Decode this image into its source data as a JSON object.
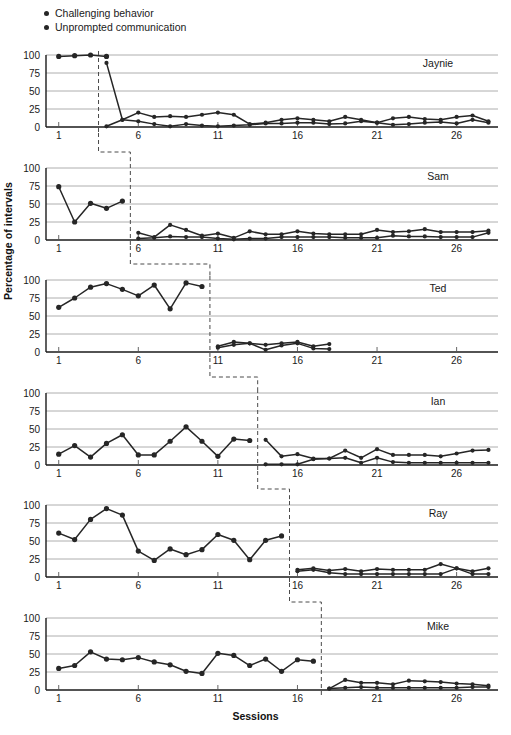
{
  "legend": {
    "items": [
      {
        "label": "Challenging behavior",
        "color": "#262626",
        "marker": "dot-icon"
      },
      {
        "label": "Unprompted communication",
        "color": "#262626",
        "marker": "dot-icon"
      }
    ]
  },
  "axes": {
    "ylabel": "Percentage of intervals",
    "xlabel": "Sessions",
    "yticks": [
      0,
      25,
      50,
      75,
      100
    ],
    "xticks": [
      1,
      6,
      11,
      16,
      21,
      26
    ],
    "ylim": [
      0,
      100
    ],
    "xlim": [
      0.2,
      28.6
    ],
    "grid": true
  },
  "chart_data": {
    "type": "line",
    "title": "",
    "subtitle": "",
    "xlabel": "Sessions",
    "ylabel": "Percentage of intervals",
    "ylim": [
      0,
      100
    ],
    "xlim": [
      0.2,
      28.6
    ],
    "yticks": [
      0,
      25,
      50,
      75,
      100
    ],
    "xticks": [
      1,
      6,
      11,
      16,
      21,
      26
    ],
    "grid": true,
    "legend_position": "top-left",
    "legend": [
      "Challenging behavior",
      "Unprompted communication"
    ],
    "design": "multiple-baseline-across-participants",
    "panels": [
      {
        "name": "Jaynie",
        "baseline_end_session": 3.5,
        "series": [
          {
            "name": "Challenging behavior",
            "baseline": {
              "x": [
                1,
                2,
                3,
                4
              ],
              "y": [
                98,
                99,
                100,
                98
              ]
            },
            "intervention": {
              "x": [
                4,
                5,
                6,
                7,
                8,
                9,
                10,
                11,
                12,
                13,
                14,
                15,
                16,
                17,
                18,
                19,
                20,
                21,
                22,
                23,
                24,
                25,
                26,
                27,
                28
              ],
              "y": [
                89,
                10,
                8,
                4,
                1,
                4,
                2,
                1,
                2,
                3,
                5,
                5,
                6,
                6,
                4,
                5,
                8,
                6,
                3,
                4,
                6,
                7,
                5,
                10,
                6
              ]
            }
          },
          {
            "name": "Unprompted communication",
            "baseline": {
              "x": [],
              "y": []
            },
            "intervention": {
              "x": [
                4,
                5,
                6,
                7,
                8,
                9,
                10,
                11,
                12,
                13,
                14,
                15,
                16,
                17,
                18,
                19,
                20,
                21,
                22,
                23,
                24,
                25,
                26,
                27,
                28
              ],
              "y": [
                1,
                10,
                20,
                14,
                15,
                14,
                17,
                20,
                17,
                4,
                6,
                10,
                12,
                10,
                8,
                14,
                10,
                6,
                12,
                14,
                11,
                10,
                14,
                16,
                8
              ]
            }
          }
        ]
      },
      {
        "name": "Sam",
        "baseline_end_session": 5.5,
        "series": [
          {
            "name": "Challenging behavior",
            "baseline": {
              "x": [
                1,
                2,
                3,
                4,
                5
              ],
              "y": [
                74,
                25,
                51,
                44,
                54
              ]
            },
            "intervention": {
              "x": [
                6,
                7,
                8,
                9,
                10,
                11,
                12,
                13,
                14,
                15,
                16,
                17,
                18,
                19,
                20,
                21,
                22,
                23,
                24,
                25,
                26,
                27,
                28
              ],
              "y": [
                2,
                3,
                5,
                4,
                4,
                2,
                1,
                2,
                2,
                4,
                4,
                4,
                4,
                3,
                3,
                3,
                6,
                5,
                5,
                4,
                4,
                4,
                10
              ]
            }
          },
          {
            "name": "Unprompted communication",
            "baseline": {
              "x": [],
              "y": []
            },
            "intervention": {
              "x": [
                6,
                7,
                8,
                9,
                10,
                11,
                12,
                13,
                14,
                15,
                16,
                17,
                18,
                19,
                20,
                21,
                22,
                23,
                24,
                25,
                26,
                27,
                28
              ],
              "y": [
                10,
                4,
                21,
                14,
                6,
                9,
                3,
                12,
                8,
                8,
                12,
                9,
                8,
                8,
                8,
                14,
                11,
                12,
                15,
                11,
                11,
                11,
                13
              ]
            }
          }
        ]
      },
      {
        "name": "Ted",
        "baseline_end_session": 10.5,
        "series": [
          {
            "name": "Challenging behavior",
            "baseline": {
              "x": [
                1,
                2,
                3,
                4,
                5,
                6,
                7,
                8,
                9,
                10
              ],
              "y": [
                62,
                75,
                90,
                95,
                87,
                78,
                93,
                60,
                96,
                91
              ]
            },
            "intervention": {
              "x": [
                11,
                12,
                13,
                14,
                15,
                16,
                17,
                18
              ],
              "y": [
                6,
                10,
                12,
                3,
                9,
                12,
                5,
                4
              ]
            }
          },
          {
            "name": "Unprompted communication",
            "baseline": {
              "x": [],
              "y": []
            },
            "intervention": {
              "x": [
                11,
                12,
                13,
                14,
                15,
                16,
                17,
                18
              ],
              "y": [
                8,
                14,
                12,
                10,
                12,
                14,
                8,
                11
              ]
            }
          }
        ]
      },
      {
        "name": "Ian",
        "baseline_end_session": 13.5,
        "series": [
          {
            "name": "Challenging behavior",
            "baseline": {
              "x": [
                1,
                2,
                3,
                4,
                5,
                6,
                7,
                8,
                9,
                10,
                11,
                12,
                13
              ],
              "y": [
                15,
                27,
                11,
                30,
                42,
                14,
                14,
                33,
                53,
                33,
                12,
                36,
                34
              ]
            },
            "intervention": {
              "x": [
                14,
                15,
                16,
                17,
                18,
                19,
                20,
                21,
                22,
                23,
                24,
                25,
                26,
                27,
                28
              ],
              "y": [
                1,
                1,
                1,
                8,
                9,
                10,
                3,
                10,
                4,
                3,
                3,
                3,
                3,
                3,
                3
              ]
            }
          },
          {
            "name": "Unprompted communication",
            "baseline": {
              "x": [],
              "y": []
            },
            "intervention": {
              "x": [
                14,
                15,
                16,
                17,
                18,
                19,
                20,
                21,
                22,
                23,
                24,
                25,
                26,
                27,
                28
              ],
              "y": [
                35,
                12,
                15,
                9,
                9,
                20,
                10,
                22,
                14,
                14,
                14,
                12,
                16,
                20,
                21
              ]
            }
          }
        ]
      },
      {
        "name": "Ray",
        "baseline_end_session": 15.5,
        "series": [
          {
            "name": "Challenging behavior",
            "baseline": {
              "x": [
                1,
                2,
                3,
                4,
                5,
                6,
                7,
                8,
                9,
                10,
                11,
                12,
                13,
                14,
                15
              ],
              "y": [
                61,
                52,
                80,
                95,
                86,
                36,
                23,
                39,
                31,
                38,
                59,
                51,
                24,
                51,
                57
              ]
            },
            "intervention": {
              "x": [
                16,
                17,
                18,
                19,
                20,
                21,
                22,
                23,
                24,
                25,
                26,
                27,
                28
              ],
              "y": [
                8,
                10,
                6,
                4,
                4,
                4,
                4,
                4,
                4,
                4,
                12,
                4,
                4
              ]
            }
          },
          {
            "name": "Unprompted communication",
            "baseline": {
              "x": [],
              "y": []
            },
            "intervention": {
              "x": [
                16,
                17,
                18,
                19,
                20,
                21,
                22,
                23,
                24,
                25,
                26,
                27,
                28
              ],
              "y": [
                10,
                12,
                9,
                11,
                8,
                11,
                10,
                10,
                10,
                18,
                12,
                8,
                12
              ]
            }
          }
        ]
      },
      {
        "name": "Mike",
        "baseline_end_session": 17.5,
        "series": [
          {
            "name": "Challenging behavior",
            "baseline": {
              "x": [
                1,
                2,
                3,
                4,
                5,
                6,
                7,
                8,
                9,
                10,
                11,
                12,
                13,
                14,
                15,
                16,
                17
              ],
              "y": [
                30,
                34,
                53,
                43,
                42,
                45,
                39,
                35,
                26,
                23,
                51,
                48,
                34,
                43,
                26,
                42,
                40
              ]
            },
            "intervention": {
              "x": [
                18,
                19,
                20,
                21,
                22,
                23,
                24,
                25,
                26,
                27,
                28
              ],
              "y": [
                2,
                3,
                4,
                3,
                3,
                3,
                3,
                3,
                3,
                4,
                4
              ]
            }
          },
          {
            "name": "Unprompted communication",
            "baseline": {
              "x": [],
              "y": []
            },
            "intervention": {
              "x": [
                18,
                19,
                20,
                21,
                22,
                23,
                24,
                25,
                26,
                27,
                28
              ],
              "y": [
                2,
                14,
                10,
                10,
                8,
                13,
                12,
                11,
                9,
                8,
                6
              ]
            }
          }
        ]
      }
    ]
  }
}
